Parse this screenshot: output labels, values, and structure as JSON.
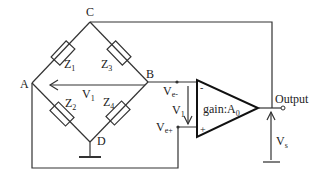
{
  "nodes": {
    "A": "A",
    "B": "B",
    "C": "C",
    "D": "D"
  },
  "impedances": {
    "z1": {
      "main": "Z",
      "sub": "1"
    },
    "z2": {
      "main": "Z",
      "sub": "2"
    },
    "z3": {
      "main": "Z",
      "sub": "3"
    },
    "z4": {
      "main": "Z",
      "sub": "4"
    }
  },
  "voltages": {
    "v1_bridge": {
      "main": "V",
      "sub": "1"
    },
    "v1_amp": {
      "main": "V",
      "sub": "1"
    },
    "ve_minus": {
      "main": "V",
      "sub": "e-"
    },
    "ve_plus": {
      "main": "V",
      "sub": "e+"
    },
    "vs": {
      "main": "V",
      "sub": "s"
    }
  },
  "amplifier": {
    "minus_sign": "-",
    "plus_sign": "+",
    "gain_label": "gain:A",
    "gain_sub": "0"
  },
  "output_label": "Output",
  "colors": {
    "line": "#333333",
    "background": "#ffffff"
  }
}
